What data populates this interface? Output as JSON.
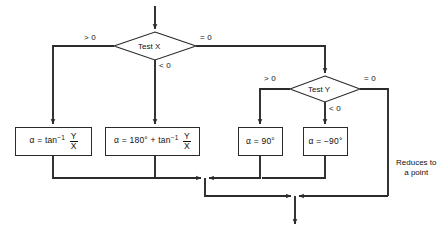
{
  "diagram": {
    "stroke_color": "#2b2b2b",
    "text_color": "#111111",
    "background": "#ffffff"
  },
  "decisions": [
    {
      "id": "test-x",
      "label": "Test X"
    },
    {
      "id": "test-y",
      "label": "Test Y"
    }
  ],
  "edge_labels": {
    "x_gt": "> 0",
    "x_eq": "= 0",
    "x_lt": "< 0",
    "y_gt": "> 0",
    "y_eq": "= 0",
    "y_lt": "< 0"
  },
  "process_boxes": [
    {
      "id": "alpha-atan",
      "alpha": "α",
      "equals": "=",
      "operator": "tan",
      "exponent": "−1",
      "numerator": "Y",
      "denominator": "X",
      "prefix": "",
      "plus": ""
    },
    {
      "id": "alpha-180-atan",
      "alpha": "α",
      "equals": "=",
      "operator": "tan",
      "exponent": "−1",
      "numerator": "Y",
      "denominator": "X",
      "prefix": "180°",
      "plus": "+"
    },
    {
      "id": "alpha-90",
      "text": "α = 90°"
    },
    {
      "id": "alpha-minus-90",
      "text": "α = −90°"
    }
  ],
  "annotations": {
    "reduces_line1": "Reduces to",
    "reduces_line2": "a point"
  }
}
